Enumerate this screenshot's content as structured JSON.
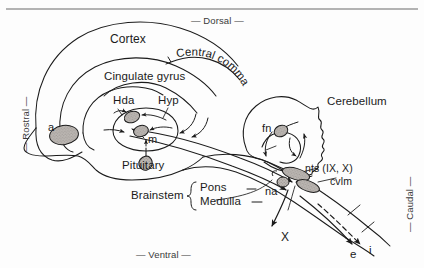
{
  "figure": {
    "type": "neuroanatomical-schematic",
    "top_rule_color": "#9a9a9a",
    "line_color": "#1b1b1b",
    "nucleus_fill": "#b9b4b0",
    "background": "#fdfdfd"
  },
  "orientation": {
    "dorsal": "— Dorsal —",
    "ventral": "— Ventral —",
    "rostral": "— Rostral —",
    "caudal": "— Caudal —"
  },
  "structures": {
    "cortex": "Cortex",
    "cingulate_gyrus": "Cingulate gyrus",
    "central_command": "Central command",
    "hda": "Hda",
    "hyp": "Hyp",
    "amygdala": "a",
    "mammillary": "m",
    "pituitary": "Pituitary",
    "cerebellum": "Cerebellum",
    "fastigial_nucleus": "fn",
    "nts": "nts (IX, X)",
    "cvlm": "cvlm",
    "nucleus_ambiguus": "na",
    "brainstem": "Brainstem",
    "pons": "Pons",
    "medulla": "Medulla"
  },
  "pathways": {
    "vagus": "X",
    "efferent": "e",
    "afferent": "i"
  }
}
